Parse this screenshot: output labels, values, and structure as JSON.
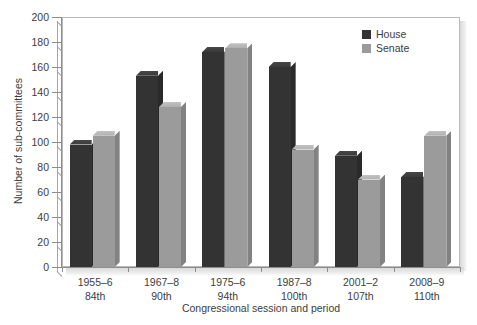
{
  "chart_data": {
    "type": "bar",
    "title": "",
    "xlabel": "Congressional session and period",
    "ylabel": "Number of sub-committees",
    "ylim": [
      0,
      200
    ],
    "ytick_step": 20,
    "yticks": [
      200,
      180,
      160,
      140,
      120,
      100,
      80,
      60,
      40,
      20,
      0
    ],
    "grid": false,
    "legend_position": "top-right",
    "categories": [
      {
        "period": "1955–6",
        "session": "84th"
      },
      {
        "period": "1967–8",
        "session": "90th"
      },
      {
        "period": "1975–6",
        "session": "94th"
      },
      {
        "period": "1987–8",
        "session": "100th"
      },
      {
        "period": "2001–2",
        "session": "107th"
      },
      {
        "period": "2008–9",
        "session": "110th"
      }
    ],
    "series": [
      {
        "name": "House",
        "color": "#333333",
        "values": [
          98,
          153,
          172,
          160,
          89,
          72
        ]
      },
      {
        "name": "Senate",
        "color": "#9b9b9b",
        "values": [
          105,
          128,
          175,
          94,
          70,
          105
        ]
      }
    ]
  },
  "legend": {
    "items": [
      {
        "label": "House"
      },
      {
        "label": "Senate"
      }
    ]
  }
}
